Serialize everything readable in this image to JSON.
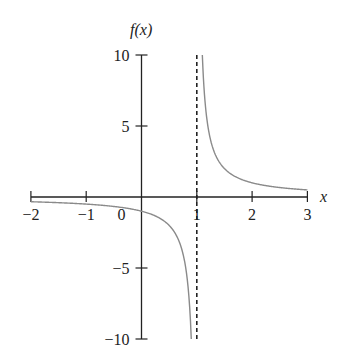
{
  "chart_data": {
    "type": "line",
    "title": "",
    "function": "f(x) = 1/(x - 1)",
    "xlabel": "x",
    "ylabel": "f(x)",
    "xlim": [
      -2,
      3
    ],
    "ylim": [
      -10,
      10
    ],
    "x_ticks": [
      -2,
      -1,
      0,
      1,
      2,
      3
    ],
    "x_tick_labels": [
      "−2",
      "−1",
      "0",
      "1",
      "2",
      "3"
    ],
    "y_ticks": [
      -10,
      -5,
      5,
      10
    ],
    "y_tick_labels": [
      "−10",
      "−5",
      "5",
      "10"
    ],
    "grid": false,
    "legend": null,
    "asymptote": {
      "type": "vertical",
      "x": 1,
      "style": "dashed"
    },
    "series": [
      {
        "name": "left branch",
        "x": [
          -2,
          -1,
          0,
          0.5,
          0.8,
          0.9
        ],
        "y": [
          -0.333,
          -0.5,
          -1,
          -2,
          -5,
          -10
        ]
      },
      {
        "name": "right branch",
        "x": [
          1.1,
          1.2,
          1.5,
          2,
          2.5,
          3
        ],
        "y": [
          10,
          5,
          2,
          1,
          0.667,
          0.5
        ]
      }
    ],
    "colors": {
      "axis": "#222222",
      "curve": "#8a8a8a",
      "asymptote": "#222222"
    }
  }
}
